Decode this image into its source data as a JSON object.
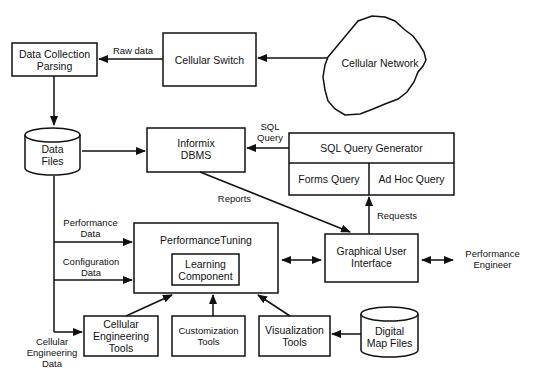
{
  "nodes": {
    "data_collection": {
      "line1": "Data Collection",
      "line2": "Parsing"
    },
    "cellular_switch": {
      "label": "Cellular Switch"
    },
    "cellular_network": {
      "label": "Cellular Network"
    },
    "data_files": {
      "line1": "Data",
      "line2": "Files"
    },
    "informix": {
      "line1": "Informix",
      "line2": "DBMS"
    },
    "sql_generator": {
      "label": "SQL Query Generator",
      "forms": "Forms Query",
      "adhoc": "Ad Hoc Query"
    },
    "performance_tuning": {
      "label": "PerformanceTuning"
    },
    "learning_component": {
      "line1": "Learning",
      "line2": "Component"
    },
    "gui": {
      "line1": "Graphical User",
      "line2": "Interface"
    },
    "performance_engineer": {
      "line1": "Performance",
      "line2": "Engineer"
    },
    "cellular_eng_tools": {
      "line1": "Cellular",
      "line2": "Engineering",
      "line3": "Tools"
    },
    "customization_tools": {
      "line1": "Customization",
      "line2": "Tools"
    },
    "visualization_tools": {
      "line1": "Visualization",
      "line2": "Tools"
    },
    "digital_map_files": {
      "line1": "Digital",
      "line2": "Map Files"
    }
  },
  "edges": {
    "raw_data": "Raw data",
    "sql_query": {
      "line1": "SQL",
      "line2": "Query"
    },
    "reports": "Reports",
    "requests": "Requests",
    "performance_data": {
      "line1": "Performance",
      "line2": "Data"
    },
    "configuration_data": {
      "line1": "Configuration",
      "line2": "Data"
    },
    "cellular_engineering_data": {
      "line1": "Cellular",
      "line2": "Engineering",
      "line3": "Data"
    }
  }
}
